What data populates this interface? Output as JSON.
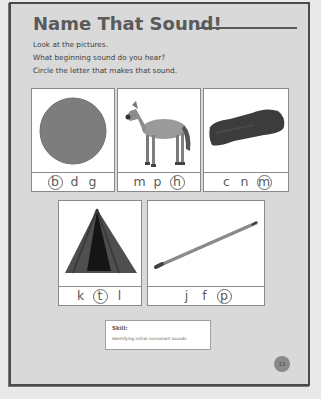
{
  "title": "Name That Sound!",
  "instructions": [
    "Look at the pictures.",
    "What beginning sound do you hear?",
    "Circle the letter that makes that sound."
  ],
  "cards": [
    {
      "picture": "ball",
      "letters": [
        "b",
        "d",
        "g"
      ],
      "circled_index": 0,
      "answer": "b"
    },
    {
      "picture": "horse",
      "letters": [
        "m",
        "p",
        "h"
      ],
      "circled_index": 2,
      "answer": "h"
    },
    {
      "picture": "mitten",
      "letters": [
        "c",
        "n",
        "m"
      ],
      "circled_index": 2,
      "answer": "m"
    },
    {
      "picture": "tent",
      "letters": [
        "k",
        "t",
        "l"
      ],
      "circled_index": 1,
      "answer": "t"
    },
    {
      "picture": "pencil",
      "letters": [
        "j",
        "f",
        "p"
      ],
      "circled_index": 2,
      "answer": "p"
    }
  ],
  "skill": {
    "label": "Skill:",
    "text": "Identifying initial consonant sounds"
  },
  "page_number": "13",
  "colors": {
    "page_bg": "#d9d9d9",
    "border": "#4a4a4a",
    "title": "#5a5a5a",
    "card_bg": "#ffffff"
  }
}
